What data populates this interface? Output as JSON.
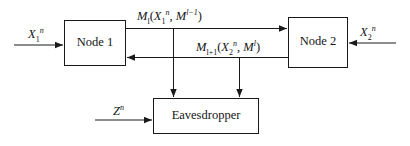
{
  "figure": {
    "background_color": "#ffffff",
    "line_color": "#1a1a1a",
    "box_fill": "#ffffff"
  },
  "nodes": {
    "node1": {
      "label": "Node 1"
    },
    "node2": {
      "label": "Node 2"
    },
    "eavesdropper": {
      "label": "Eavesdropper"
    }
  },
  "labels": {
    "x1": {
      "base": "X",
      "sub": "1",
      "sup": "n"
    },
    "x2": {
      "base": "X",
      "sub": "2",
      "sup": "n"
    },
    "z": {
      "base": "Z",
      "sub": "",
      "sup": "n"
    },
    "msg_forward": {
      "m_base": "M",
      "m_sub": "l",
      "open": "(",
      "x_base": "X",
      "x_sub": "1",
      "x_sup": "n",
      "comma": ", ",
      "m2_base": "M",
      "m2_sup": "l−1",
      "close": ")"
    },
    "msg_backward": {
      "m_base": "M",
      "m_sub": "l+1",
      "open": "(",
      "x_base": "X",
      "x_sub": "2",
      "x_sup": "n",
      "comma": ", ",
      "m2_base": "M",
      "m2_sup": "l",
      "close": ")"
    }
  },
  "edges": [
    {
      "name": "x1-input-to-node1",
      "from": "X1^n source",
      "to": "Node 1",
      "direction": "right"
    },
    {
      "name": "x2-input-to-node2",
      "from": "X2^n source",
      "to": "Node 2",
      "direction": "left"
    },
    {
      "name": "node1-to-node2",
      "from": "Node 1",
      "to": "Node 2",
      "direction": "right",
      "label": "M_l(X_1^n, M^{l-1})"
    },
    {
      "name": "node2-to-node1",
      "from": "Node 2",
      "to": "Node 1",
      "direction": "left",
      "label": "M_{l+1}(X_2^n, M^l)"
    },
    {
      "name": "forward-tap-to-eavesdropper",
      "from": "node1-to-node2 link",
      "to": "Eavesdropper",
      "direction": "down"
    },
    {
      "name": "backward-tap-to-eavesdropper",
      "from": "node2-to-node1 link",
      "to": "Eavesdropper",
      "direction": "down"
    },
    {
      "name": "z-input-to-eavesdropper",
      "from": "Z^n source",
      "to": "Eavesdropper",
      "direction": "right"
    }
  ]
}
